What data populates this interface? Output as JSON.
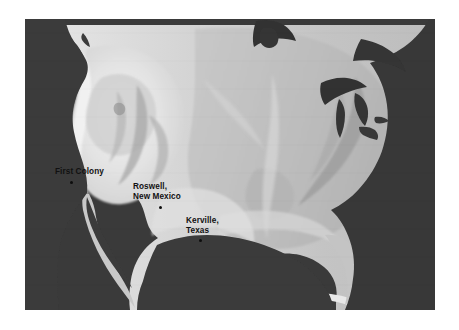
{
  "figure": {
    "type": "relief-map",
    "region": "United States",
    "style": "grayscale shaded relief",
    "frame": {
      "x": 25,
      "y": 19,
      "width": 410,
      "height": 291
    },
    "page_background": "#ffffff"
  },
  "colors": {
    "ocean": "#3a3a3a",
    "deep_water": "#2e2e2e",
    "lake": "#333333",
    "lowland": "#b9b9b9",
    "plains": "#c6c6c6",
    "midland": "#d2d2d2",
    "upland": "#dedede",
    "highland": "#ececec",
    "peak": "#f7f7f7",
    "label_text": "#111111",
    "marker": "#0d0d0d"
  },
  "markers": [
    {
      "id": "first-colony",
      "label": "First Colony",
      "lines": [
        "First Colony"
      ],
      "label_x": 55,
      "label_y": 167,
      "dot_x": 70,
      "dot_y": 181
    },
    {
      "id": "roswell-new-mexico",
      "label": "Roswell, New Mexico",
      "lines": [
        "Roswell,",
        "New Mexico"
      ],
      "label_x": 133,
      "label_y": 182,
      "dot_x": 159,
      "dot_y": 206
    },
    {
      "id": "kerville-texas",
      "label": "Kerville, Texas",
      "lines": [
        "Kerville,",
        "Texas"
      ],
      "label_x": 186,
      "label_y": 216,
      "dot_x": 199,
      "dot_y": 239
    }
  ]
}
